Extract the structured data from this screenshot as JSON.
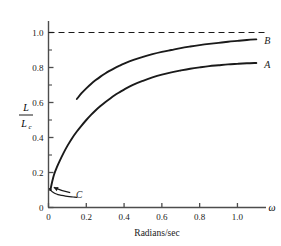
{
  "figure": {
    "title": "",
    "x_axis_title": "Radians/sec",
    "x_axis_symbol": "ω",
    "y_axis_label_numerator": "L",
    "y_axis_label_denominator": "L",
    "y_axis_label_denominator_sub": "c"
  },
  "axes": {
    "x_ticks": [
      "0",
      "0.2",
      "0.4",
      "0.6",
      "0.8",
      "1.0"
    ],
    "y_ticks": [
      "0",
      "0.2",
      "0.4",
      "0.6",
      "0.8",
      "1.0"
    ]
  },
  "labels": {
    "curve_a": "A",
    "curve_b": "B",
    "curve_c": "C"
  },
  "colors": {
    "ink": "#1a1a1a",
    "axis": "#4d4d4d",
    "background": "#ffffff"
  },
  "chart_data": {
    "type": "line",
    "title": "",
    "xlabel": "Radians/sec",
    "ylabel": "L/Lc",
    "xlim": [
      0,
      1.13
    ],
    "ylim": [
      0,
      1.06
    ],
    "grid": false,
    "legend": "inline-right-end-labels",
    "x_tick_values": [
      0,
      0.2,
      0.4,
      0.6,
      0.8,
      1.0
    ],
    "y_tick_values": [
      0,
      0.2,
      0.4,
      0.6,
      0.8,
      1.0
    ],
    "x_minor_tick_values": [
      0.1,
      0.3,
      0.5,
      0.7,
      0.9,
      1.1
    ],
    "y_minor_tick_values": [
      0.1,
      0.3,
      0.5,
      0.7,
      0.9
    ],
    "annotations": [
      {
        "name": "asymptote",
        "type": "hline",
        "y": 1.0,
        "style": "dashed",
        "label": ""
      },
      {
        "name": "arrow-to-c",
        "type": "arrow",
        "from": [
          0.115,
          0.085
        ],
        "to": [
          0.028,
          0.115
        ],
        "label": "C"
      }
    ],
    "series": [
      {
        "name": "B",
        "label": "B",
        "label_at": [
          1.105,
          0.955
        ],
        "points": [
          [
            0.15,
            0.62
          ],
          [
            0.175,
            0.653
          ],
          [
            0.2,
            0.681
          ],
          [
            0.225,
            0.706
          ],
          [
            0.25,
            0.728
          ],
          [
            0.275,
            0.748
          ],
          [
            0.3,
            0.766
          ],
          [
            0.325,
            0.782
          ],
          [
            0.35,
            0.797
          ],
          [
            0.375,
            0.81
          ],
          [
            0.4,
            0.822
          ],
          [
            0.45,
            0.843
          ],
          [
            0.5,
            0.861
          ],
          [
            0.55,
            0.876
          ],
          [
            0.6,
            0.889
          ],
          [
            0.65,
            0.9
          ],
          [
            0.7,
            0.911
          ],
          [
            0.75,
            0.92
          ],
          [
            0.8,
            0.928
          ],
          [
            0.85,
            0.935
          ],
          [
            0.9,
            0.941
          ],
          [
            0.95,
            0.947
          ],
          [
            1.0,
            0.952
          ],
          [
            1.05,
            0.957
          ],
          [
            1.1,
            0.961
          ]
        ]
      },
      {
        "name": "A",
        "label": "A",
        "label_at": [
          1.105,
          0.82
        ],
        "points": [
          [
            0.01,
            0.1
          ],
          [
            0.02,
            0.15
          ],
          [
            0.03,
            0.19
          ],
          [
            0.045,
            0.232
          ],
          [
            0.06,
            0.268
          ],
          [
            0.08,
            0.312
          ],
          [
            0.1,
            0.352
          ],
          [
            0.125,
            0.396
          ],
          [
            0.15,
            0.434
          ],
          [
            0.175,
            0.468
          ],
          [
            0.2,
            0.5
          ],
          [
            0.225,
            0.529
          ],
          [
            0.25,
            0.556
          ],
          [
            0.275,
            0.58
          ],
          [
            0.3,
            0.602
          ],
          [
            0.325,
            0.622
          ],
          [
            0.35,
            0.641
          ],
          [
            0.375,
            0.658
          ],
          [
            0.4,
            0.674
          ],
          [
            0.45,
            0.702
          ],
          [
            0.5,
            0.724
          ],
          [
            0.55,
            0.743
          ],
          [
            0.6,
            0.759
          ],
          [
            0.65,
            0.772
          ],
          [
            0.7,
            0.783
          ],
          [
            0.75,
            0.793
          ],
          [
            0.8,
            0.801
          ],
          [
            0.85,
            0.808
          ],
          [
            0.9,
            0.813
          ],
          [
            0.95,
            0.818
          ],
          [
            1.0,
            0.821
          ],
          [
            1.05,
            0.824
          ],
          [
            1.1,
            0.826
          ]
        ]
      },
      {
        "name": "C",
        "label": "C",
        "label_at": [
          0.145,
          0.072
        ],
        "points": [
          [
            0.005,
            0.108
          ],
          [
            0.012,
            0.098
          ],
          [
            0.022,
            0.088
          ],
          [
            0.035,
            0.08
          ],
          [
            0.05,
            0.074
          ],
          [
            0.07,
            0.069
          ],
          [
            0.09,
            0.065
          ],
          [
            0.11,
            0.062
          ],
          [
            0.13,
            0.06
          ],
          [
            0.15,
            0.058
          ]
        ]
      }
    ]
  }
}
